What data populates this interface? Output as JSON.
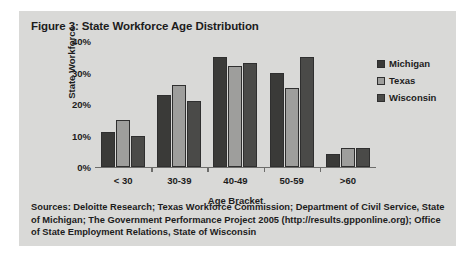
{
  "figure": {
    "title": "Figure 3: State Workforce Age Distribution",
    "sources": "Sources: Deloitte Research; Texas Workforce Commission; Department of Civil Service, State of Michigan; The Government Performance Project 2005 (http://results.gpponline.org); Office of State Employment Relations, State of Wisconsin",
    "panel_bg": "#d9d9d7"
  },
  "chart_data": {
    "type": "bar",
    "title": "Figure 3: State Workforce Age Distribution",
    "xlabel": "Age Bracket",
    "ylabel": "State Workforce",
    "categories": [
      "< 30",
      "30-39",
      "40-49",
      "50-59",
      ">60"
    ],
    "ylim": [
      0,
      40
    ],
    "ytick_values": [
      0,
      10,
      20,
      30,
      40
    ],
    "ytick_labels": [
      "0%",
      "10%",
      "20%",
      "30%",
      "40%"
    ],
    "grid": false,
    "legend_position": "right",
    "series": [
      {
        "name": "Michigan",
        "color": "#3a3a38",
        "values": [
          11,
          23,
          35,
          30,
          4
        ]
      },
      {
        "name": "Texas",
        "color": "#9e9e9c",
        "values": [
          15,
          26,
          32,
          25,
          6
        ]
      },
      {
        "name": "Wisconsin",
        "color": "#4a4a48",
        "values": [
          10,
          21,
          33,
          35,
          6
        ]
      }
    ]
  }
}
